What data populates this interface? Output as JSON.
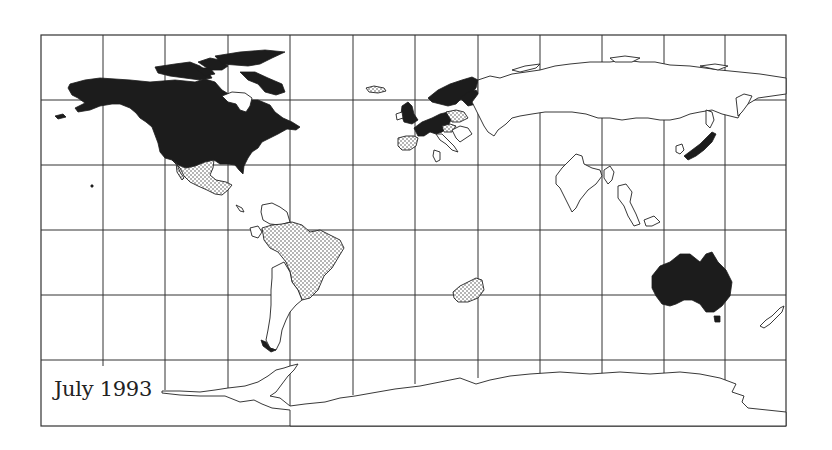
{
  "figure": {
    "label": "July 1993",
    "projection": "equirectangular world map with graticule",
    "colors": {
      "background": "#ffffff",
      "grid": "#333333",
      "category_solid": "#1c1c1c",
      "category_dotted": "#dotted-pattern",
      "outline": "#222222"
    }
  },
  "legend_categories": [
    {
      "style": "solid-black",
      "regions": [
        "Canada",
        "United States",
        "Alaska",
        "Greenland",
        "United Kingdom",
        "Ireland",
        "France",
        "Germany",
        "Benelux",
        "Norway",
        "Sweden",
        "Finland",
        "Denmark",
        "Switzerland",
        "Austria",
        "Italy",
        "Japan",
        "Australia"
      ]
    },
    {
      "style": "dotted",
      "regions": [
        "Mexico",
        "Brazil",
        "Spain",
        "Portugal",
        "Poland",
        "Czech Republic",
        "Hungary",
        "South Africa",
        "Iceland"
      ]
    },
    {
      "style": "outline-only",
      "regions": [
        "Russia",
        "India",
        "China",
        "Southeast Asia",
        "Argentina",
        "Chile",
        "Rest of South America",
        "New Zealand",
        "Antarctica",
        "Balkans",
        "Middle East"
      ]
    }
  ]
}
